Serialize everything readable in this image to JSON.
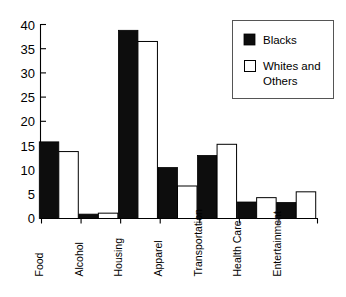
{
  "chart_data": {
    "type": "bar",
    "title": "",
    "subtitle": "",
    "xlabel": "",
    "ylabel": "",
    "ylim": [
      0,
      40
    ],
    "yticks": [
      0,
      5,
      10,
      15,
      20,
      25,
      30,
      35,
      40
    ],
    "ytick_labels": [
      "0",
      "5",
      "10",
      "15",
      "20",
      "25",
      "30",
      "35",
      "40"
    ],
    "grid": false,
    "legend_position": "top-right",
    "categories": [
      "Food",
      "Alcohol",
      "Housing",
      "Apparel",
      "Transportation",
      "Health Care",
      "Entertainment"
    ],
    "series": [
      {
        "name": "Blacks",
        "color": "#0d0d0d",
        "style": "filled",
        "values": [
          15.8,
          0.9,
          38.8,
          10.5,
          13.0,
          3.4,
          3.3
        ]
      },
      {
        "name": "Whites and Others",
        "color": "#ffffff",
        "style": "outlined",
        "values": [
          13.8,
          1.1,
          36.5,
          6.7,
          15.3,
          4.3,
          5.5
        ]
      }
    ]
  },
  "legend": {
    "entries": [
      {
        "label": "Blacks",
        "swatch": "filled-square-icon"
      },
      {
        "label": "Whites and Others",
        "swatch": "empty-square-icon"
      }
    ]
  },
  "colors": {
    "series_black": "#0d0d0d",
    "series_white": "#ffffff",
    "axis": "#000000",
    "legend_border": "#555555",
    "background": "#ffffff"
  }
}
